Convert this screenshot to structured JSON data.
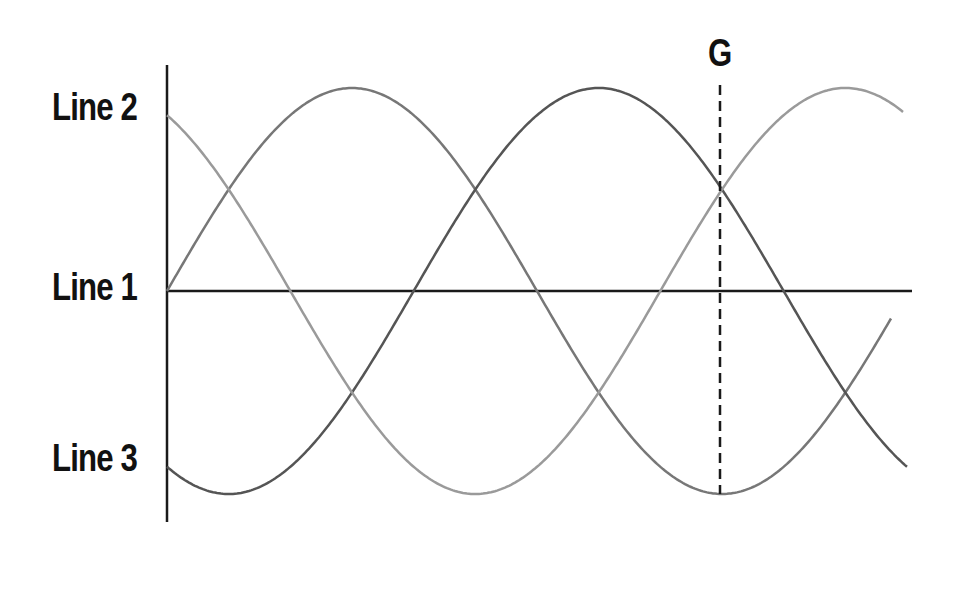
{
  "diagram": {
    "title": "",
    "labels": {
      "line2": "Line 2",
      "line1": "Line 1",
      "line3": "Line 3",
      "marker": "G"
    },
    "colors": {
      "axis": "#1a1a1a",
      "line1": "#1a1a1a",
      "wave_a": "#777777",
      "wave_b": "#555555",
      "wave_c": "#9a9a9a",
      "marker_line": "#1a1a1a"
    },
    "geometry": {
      "axis_x": 167,
      "axis_top": 65,
      "axis_bottom": 522,
      "baseline_y": 291,
      "baseline_end_x": 912,
      "amplitude": 203,
      "period": 740,
      "x_start": 167,
      "marker_x": 720,
      "marker_top": 85,
      "marker_bottom": 494
    },
    "waves": [
      {
        "name": "wave-a",
        "phase_deg": 0,
        "x_end": 892,
        "color_key": "wave_a"
      },
      {
        "name": "wave-b",
        "phase_deg": -120,
        "x_end": 908,
        "color_key": "wave_b"
      },
      {
        "name": "wave-c",
        "phase_deg": 120,
        "x_end": 903,
        "color_key": "wave_c"
      }
    ]
  }
}
